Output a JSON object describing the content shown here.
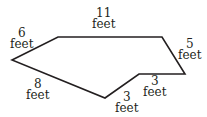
{
  "diagram": {
    "shape": "hexagon",
    "stroke_color": "#231f20",
    "vertices": [
      [
        12,
        60
      ],
      [
        58,
        37
      ],
      [
        162,
        37
      ],
      [
        185,
        74
      ],
      [
        139,
        74
      ],
      [
        105,
        98
      ]
    ],
    "sides": [
      {
        "length": "6",
        "unit": "feet"
      },
      {
        "length": "11",
        "unit": "feet"
      },
      {
        "length": "5",
        "unit": "feet"
      },
      {
        "length": "3",
        "unit": "feet"
      },
      {
        "length": "3",
        "unit": "feet"
      },
      {
        "length": "8",
        "unit": "feet"
      }
    ]
  }
}
